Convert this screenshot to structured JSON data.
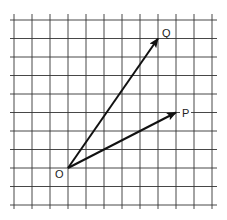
{
  "diagram": {
    "type": "vector-diagram-on-grid",
    "grid": {
      "columns": 11,
      "rows": 10,
      "origin_px": [
        14,
        20
      ],
      "cell_px": [
        18,
        18.5
      ],
      "line_color": "#333333"
    },
    "points": {
      "O": {
        "label": "O",
        "grid": [
          3,
          8
        ]
      },
      "P": {
        "label": "P",
        "grid": [
          9,
          5
        ]
      },
      "Q": {
        "label": "Q",
        "grid": [
          8,
          1
        ]
      }
    },
    "vectors": [
      {
        "from": "O",
        "to": "Q",
        "components": [
          5,
          7
        ]
      },
      {
        "from": "O",
        "to": "P",
        "components": [
          6,
          3
        ]
      }
    ],
    "vector_color": "#111111"
  }
}
